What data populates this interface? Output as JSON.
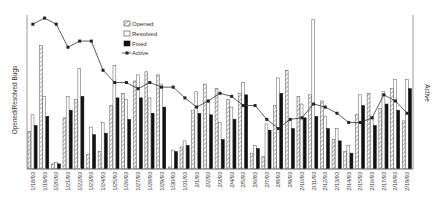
{
  "chart_data": {
    "type": "bar",
    "title": "",
    "xlabel": "",
    "ylabel": "Opened/Resolved Bugs",
    "y2label": "Active",
    "ylim": [
      0,
      100
    ],
    "y2lim": [
      0,
      100
    ],
    "grid": false,
    "legend_position": "top-center",
    "legend": [
      "Opened",
      "Resolved",
      "Fixed",
      "Active"
    ],
    "categories": [
      "1/18/93",
      "1/19/93",
      "1/20/93",
      "1/21/93",
      "1/22/93",
      "1/23/93",
      "1/24/93",
      "1/25/93",
      "1/26/93",
      "1/27/93",
      "1/28/93",
      "1/29/93",
      "1/30/93",
      "1/31/93",
      "2/1/93",
      "2/2/93",
      "2/3/93",
      "2/4/93",
      "2/5/93",
      "2/6/93",
      "2/7/93",
      "2/8/93",
      "2/9/93",
      "2/10/93",
      "2/11/93",
      "2/12/93",
      "2/13/93",
      "2/14/93",
      "2/15/93",
      "2/16/93",
      "2/17/93",
      "2/18/93",
      "2/19/93"
    ],
    "series": [
      {
        "name": "Opened",
        "style": "hatched",
        "axis": "left",
        "values": [
          24,
          80,
          3,
          33,
          45,
          9,
          11,
          41,
          49,
          57,
          63,
          61,
          1,
          14,
          38,
          55,
          52,
          45,
          49,
          10,
          8,
          41,
          64,
          47,
          48,
          44,
          19,
          11,
          35,
          49,
          39,
          52,
          31
        ]
      },
      {
        "name": "Resolved",
        "style": "white",
        "axis": "left",
        "values": [
          35,
          47,
          4,
          47,
          65,
          27,
          30,
          67,
          45,
          61,
          46,
          55,
          12,
          18,
          50,
          43,
          30,
          40,
          56,
          15,
          29,
          59,
          31,
          42,
          97,
          34,
          26,
          15,
          48,
          34,
          50,
          58,
          58
        ]
      },
      {
        "name": "Fixed",
        "style": "black",
        "axis": "left",
        "values": [
          28,
          34,
          3,
          38,
          47,
          22,
          23,
          46,
          32,
          46,
          36,
          40,
          11,
          15,
          36,
          35,
          19,
          32,
          48,
          13,
          25,
          49,
          26,
          33,
          34,
          26,
          18,
          10,
          41,
          28,
          42,
          38,
          52
        ]
      },
      {
        "name": "Active",
        "style": "line-marker",
        "axis": "right",
        "values": [
          94,
          98,
          94,
          79,
          83,
          83,
          64,
          56,
          56,
          52,
          56,
          53,
          53,
          46,
          40,
          44,
          49,
          47,
          41,
          41,
          32,
          26,
          32,
          33,
          42,
          40,
          36,
          30,
          30,
          33,
          48,
          44,
          36
        ]
      }
    ]
  },
  "labels": {
    "ylabel": "Opened/Resolved Bugs",
    "y2label": "Active",
    "legend": {
      "opened": "Opened",
      "resolved": "Resolved",
      "fixed": "Fixed",
      "active": "Active"
    }
  },
  "colors": {
    "axis": "#999999",
    "bar_outline": "#444444",
    "hatch": "#777777",
    "fixed": "#111111",
    "line": "#333333"
  }
}
